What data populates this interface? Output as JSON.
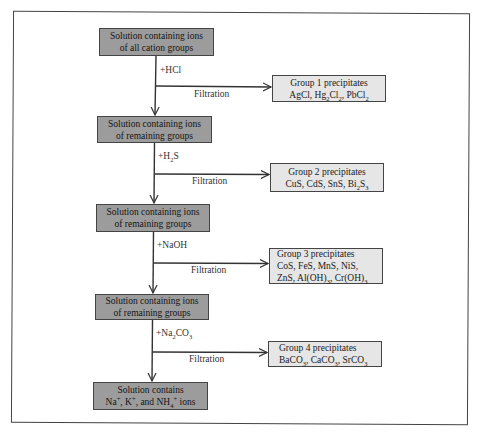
{
  "diagram": {
    "type": "flowchart",
    "topic": "Qualitative analysis separation of cation groups",
    "main_steps": [
      {
        "id": "start",
        "line1": "Solution containing ions",
        "line2": "of all cation groups"
      },
      {
        "id": "after_group1",
        "line1": "Solution containing ions",
        "line2": "of remaining groups"
      },
      {
        "id": "after_group2",
        "line1": "Solution containing ions",
        "line2": "of remaining groups"
      },
      {
        "id": "after_group3",
        "line1": "Solution containing ions",
        "line2": "of remaining groups"
      },
      {
        "id": "final",
        "line1": "Solution contains",
        "line2_html": "Na<sup>+</sup>, K<sup>+</sup>, and NH<sub>4</sub><sup>+</sup> ions"
      }
    ],
    "reagents": [
      {
        "html": "+HCl"
      },
      {
        "html": "+H<sub>2</sub>S"
      },
      {
        "html": "+NaOH"
      },
      {
        "html": "+Na<sub>2</sub>CO<sub>3</sub>"
      }
    ],
    "process_label": "Filtration",
    "precipitates": [
      {
        "title": "Group 1 precipitates",
        "lines_html": [
          "AgCl, Hg<sub>2</sub>Cl<sub>2</sub>, PbCl<sub>2</sub>"
        ]
      },
      {
        "title": "Group 2 precipitates",
        "lines_html": [
          "CuS, CdS, SnS, Bi<sub>2</sub>S<sub>3</sub>"
        ]
      },
      {
        "title": "Group 3 precipitates",
        "lines_html": [
          "CoS, FeS, MnS, NiS,",
          "ZnS, Al(OH)<sub>3</sub>, Cr(OH)<sub>3</sub>"
        ]
      },
      {
        "title": "Group 4 precipitates",
        "lines_html": [
          "BaCO<sub>3</sub>, CaCO<sub>3</sub>, SrCO<sub>3</sub>"
        ]
      }
    ]
  },
  "colors": {
    "main_box_fill": "#9c9c9c",
    "precipitate_box_fill": "#e6e6e6",
    "line": "#333333"
  }
}
